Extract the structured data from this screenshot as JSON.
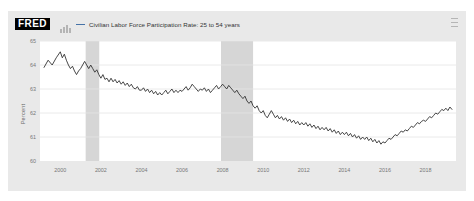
{
  "header": {
    "logo_text": "FRED",
    "logo_icon": "mini-bar-chart-icon",
    "menu_icon": "hamburger-menu-icon",
    "legend_label": "Civilian Labor Force Participation Rate: 25 to 54 years"
  },
  "chart_data": {
    "type": "line",
    "title": "",
    "subtitle": "",
    "xlabel": "",
    "ylabel": "Percent",
    "legend": [
      "Civilian Labor Force Participation Rate: 25 to 54 years"
    ],
    "legend_position": "top",
    "grid": true,
    "line_color": "#333333",
    "recession_band_color": "#d6d6d6",
    "xlim": [
      1999.0,
      2019.5
    ],
    "ylim": [
      60,
      65
    ],
    "yticks": [
      60,
      61,
      62,
      63,
      64,
      65
    ],
    "ytick_labels": [
      "60",
      "61",
      "62",
      "63",
      "64",
      "65"
    ],
    "xticks": [
      2000,
      2002,
      2004,
      2006,
      2008,
      2010,
      2012,
      2014,
      2016,
      2018
    ],
    "xtick_labels": [
      "2000",
      "2002",
      "2004",
      "2006",
      "2008",
      "2010",
      "2012",
      "2014",
      "2016",
      "2018"
    ],
    "recessions": [
      {
        "start": 2001.25,
        "end": 2001.92
      },
      {
        "start": 2007.92,
        "end": 2009.5
      }
    ],
    "x": [
      1999.2,
      1999.4,
      1999.6,
      1999.8,
      2000.0,
      2000.1,
      2000.2,
      2000.3,
      2000.4,
      2000.5,
      2000.6,
      2000.7,
      2000.8,
      2000.9,
      2001.0,
      2001.1,
      2001.2,
      2001.3,
      2001.4,
      2001.5,
      2001.6,
      2001.7,
      2001.8,
      2001.9,
      2002.0,
      2002.1,
      2002.2,
      2002.3,
      2002.4,
      2002.5,
      2002.6,
      2002.7,
      2002.8,
      2002.9,
      2003.0,
      2003.1,
      2003.2,
      2003.3,
      2003.4,
      2003.5,
      2003.6,
      2003.7,
      2003.8,
      2003.9,
      2004.0,
      2004.1,
      2004.2,
      2004.3,
      2004.4,
      2004.5,
      2004.6,
      2004.7,
      2004.8,
      2004.9,
      2005.0,
      2005.1,
      2005.2,
      2005.3,
      2005.4,
      2005.5,
      2005.6,
      2005.7,
      2005.8,
      2005.9,
      2006.0,
      2006.1,
      2006.2,
      2006.3,
      2006.4,
      2006.5,
      2006.6,
      2006.7,
      2006.8,
      2006.9,
      2007.0,
      2007.1,
      2007.2,
      2007.3,
      2007.4,
      2007.5,
      2007.6,
      2007.7,
      2007.8,
      2007.9,
      2008.0,
      2008.1,
      2008.2,
      2008.3,
      2008.4,
      2008.5,
      2008.6,
      2008.7,
      2008.8,
      2008.9,
      2009.0,
      2009.1,
      2009.2,
      2009.3,
      2009.4,
      2009.5,
      2009.6,
      2009.7,
      2009.8,
      2009.9,
      2010.0,
      2010.1,
      2010.2,
      2010.3,
      2010.4,
      2010.5,
      2010.6,
      2010.7,
      2010.8,
      2010.9,
      2011.0,
      2011.1,
      2011.2,
      2011.3,
      2011.4,
      2011.5,
      2011.6,
      2011.7,
      2011.8,
      2011.9,
      2012.0,
      2012.1,
      2012.2,
      2012.3,
      2012.4,
      2012.5,
      2012.6,
      2012.7,
      2012.8,
      2012.9,
      2013.0,
      2013.1,
      2013.2,
      2013.3,
      2013.4,
      2013.5,
      2013.6,
      2013.7,
      2013.8,
      2013.9,
      2014.0,
      2014.1,
      2014.2,
      2014.3,
      2014.4,
      2014.5,
      2014.6,
      2014.7,
      2014.8,
      2014.9,
      2015.0,
      2015.1,
      2015.2,
      2015.3,
      2015.4,
      2015.5,
      2015.6,
      2015.7,
      2015.8,
      2015.9,
      2016.0,
      2016.1,
      2016.2,
      2016.3,
      2016.4,
      2016.5,
      2016.6,
      2016.7,
      2016.8,
      2016.9,
      2017.0,
      2017.1,
      2017.2,
      2017.3,
      2017.4,
      2017.5,
      2017.6,
      2017.7,
      2017.8,
      2017.9,
      2018.0,
      2018.1,
      2018.2,
      2018.3,
      2018.4,
      2018.5,
      2018.6,
      2018.7,
      2018.8,
      2018.9,
      2019.0,
      2019.1,
      2019.2,
      2019.3
    ],
    "values": [
      63.9,
      64.2,
      64.0,
      64.3,
      64.55,
      64.3,
      64.45,
      64.2,
      64.0,
      63.85,
      63.95,
      63.75,
      63.6,
      63.75,
      63.85,
      64.0,
      64.15,
      64.0,
      63.85,
      64.0,
      63.85,
      63.7,
      63.8,
      63.6,
      63.45,
      63.6,
      63.4,
      63.45,
      63.3,
      63.45,
      63.3,
      63.4,
      63.25,
      63.35,
      63.2,
      63.3,
      63.15,
      63.25,
      63.1,
      63.2,
      63.05,
      63.0,
      63.1,
      62.95,
      62.95,
      63.05,
      62.9,
      63.0,
      62.85,
      62.95,
      62.8,
      62.9,
      62.75,
      62.85,
      62.75,
      62.85,
      62.95,
      62.8,
      62.9,
      63.0,
      62.85,
      62.95,
      62.85,
      62.95,
      62.9,
      63.0,
      63.1,
      62.95,
      63.05,
      63.2,
      63.1,
      63.0,
      62.9,
      63.0,
      62.95,
      63.05,
      62.9,
      63.0,
      62.85,
      62.95,
      63.05,
      63.15,
      63.0,
      63.1,
      63.2,
      63.1,
      63.0,
      63.15,
      63.05,
      62.95,
      62.85,
      62.95,
      62.8,
      62.7,
      62.6,
      62.7,
      62.5,
      62.4,
      62.5,
      62.3,
      62.2,
      62.3,
      62.1,
      62.0,
      62.1,
      61.9,
      61.8,
      61.95,
      62.1,
      61.95,
      61.8,
      61.9,
      61.75,
      61.85,
      61.7,
      61.8,
      61.65,
      61.75,
      61.6,
      61.7,
      61.55,
      61.65,
      61.5,
      61.6,
      61.5,
      61.6,
      61.45,
      61.55,
      61.4,
      61.5,
      61.35,
      61.45,
      61.3,
      61.4,
      61.3,
      61.4,
      61.25,
      61.35,
      61.2,
      61.3,
      61.15,
      61.25,
      61.1,
      61.2,
      61.1,
      61.2,
      61.05,
      61.15,
      61.0,
      61.1,
      60.95,
      61.05,
      60.9,
      61.0,
      60.9,
      61.0,
      60.85,
      60.95,
      60.8,
      60.9,
      60.75,
      60.85,
      60.7,
      60.8,
      60.75,
      60.85,
      60.95,
      60.9,
      61.0,
      61.1,
      61.05,
      61.15,
      61.25,
      61.2,
      61.3,
      61.25,
      61.35,
      61.45,
      61.4,
      61.5,
      61.6,
      61.55,
      61.65,
      61.7,
      61.65,
      61.75,
      61.85,
      61.8,
      61.9,
      62.0,
      61.95,
      62.05,
      62.15,
      62.1,
      62.2,
      62.1,
      62.25,
      62.15
    ]
  }
}
